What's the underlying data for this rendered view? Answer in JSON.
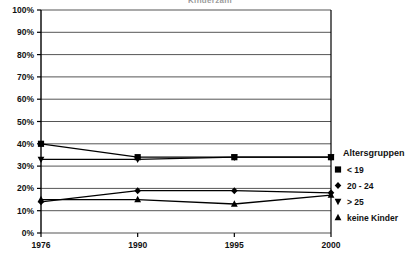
{
  "chart_data": {
    "type": "line",
    "title": "Kinderzahl",
    "categories": [
      "1976",
      "1990",
      "1995",
      "2000"
    ],
    "series": [
      {
        "name": "< 19",
        "marker": "square",
        "values": [
          40,
          34,
          34,
          34
        ]
      },
      {
        "name": "20 - 24",
        "marker": "diamond",
        "values": [
          14,
          19,
          19,
          18
        ]
      },
      {
        "name": "> 25",
        "marker": "triangle-down",
        "values": [
          33,
          33,
          34,
          34
        ]
      },
      {
        "name": "keine Kinder",
        "marker": "triangle-up",
        "values": [
          15,
          15,
          13,
          17
        ]
      }
    ],
    "xlabel": "",
    "ylabel": "",
    "ylim": [
      0,
      100
    ],
    "ytick_labels": [
      "0%",
      "10%",
      "20%",
      "30%",
      "40%",
      "50%",
      "60%",
      "70%",
      "80%",
      "90%",
      "100%"
    ],
    "ytick_values": [
      0,
      10,
      20,
      30,
      40,
      50,
      60,
      70,
      80,
      90,
      100
    ],
    "grid": true,
    "grid_axis": "y",
    "legend_position": "right",
    "legend_title": "Altersgruppen",
    "line_color": "#000000",
    "grid_color": "#555555",
    "axis_color": "#000000",
    "background": "#ffffff"
  }
}
